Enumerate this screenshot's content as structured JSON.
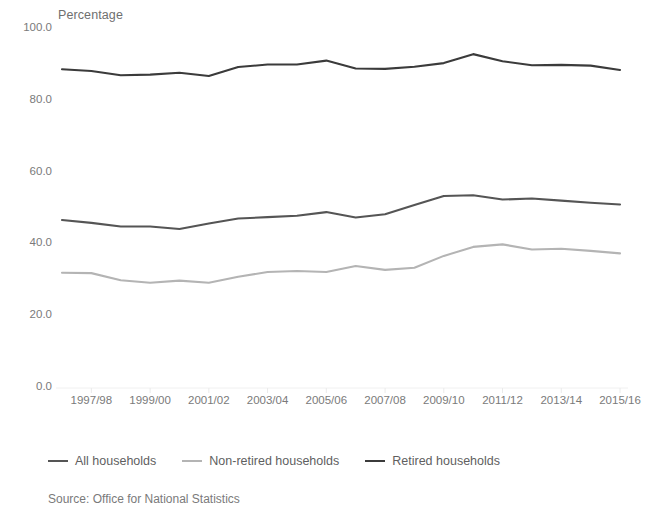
{
  "chart_data": {
    "type": "line",
    "title": "",
    "subtitle": "",
    "ylabel": "Percentage",
    "xlabel": "",
    "ylim": [
      0,
      100
    ],
    "yticks": [
      "0.0",
      "20.0",
      "40.0",
      "60.0",
      "80.0",
      "100.0"
    ],
    "ytick_values": [
      0,
      20,
      40,
      60,
      80,
      100
    ],
    "grid": false,
    "legend_position": "bottom-left",
    "categories": [
      "1996/97",
      "1997/98",
      "1998/99",
      "1999/00",
      "2000/01",
      "2001/02",
      "2002/03",
      "2003/04",
      "2004/05",
      "2005/06",
      "2006/07",
      "2007/08",
      "2008/09",
      "2009/10",
      "2010/11",
      "2011/12",
      "2012/13",
      "2013/14",
      "2014/15",
      "2015/16"
    ],
    "xtick_labels": [
      "1997/98",
      "1999/00",
      "2001/02",
      "2003/04",
      "2005/06",
      "2007/08",
      "2009/10",
      "2011/12",
      "2013/14",
      "2015/16"
    ],
    "xtick_indices": [
      1,
      3,
      5,
      7,
      9,
      11,
      13,
      15,
      17,
      19
    ],
    "series": [
      {
        "name": "All households",
        "color": "#555555",
        "width": 2.1,
        "values": [
          46.8,
          46.0,
          45.0,
          45.0,
          44.3,
          45.8,
          47.2,
          47.6,
          48.0,
          49.0,
          47.5,
          48.4,
          51.0,
          53.5,
          53.7,
          52.5,
          52.8,
          52.2,
          51.6,
          51.1
        ]
      },
      {
        "name": "Non-retired households",
        "color": "#b4b4b4",
        "width": 2.1,
        "values": [
          32.1,
          32.0,
          30.0,
          29.3,
          29.9,
          29.3,
          31.0,
          32.3,
          32.6,
          32.3,
          34.0,
          32.9,
          33.5,
          36.8,
          39.3,
          40.0,
          38.6,
          38.8,
          38.2,
          37.5
        ]
      },
      {
        "name": "Retired households",
        "color": "#3b3b3b",
        "width": 2.1,
        "values": [
          88.8,
          88.3,
          87.1,
          87.3,
          87.8,
          86.9,
          89.4,
          90.1,
          90.1,
          91.2,
          89.0,
          88.9,
          89.5,
          90.5,
          93.0,
          91.0,
          89.9,
          90.0,
          89.8,
          88.6
        ]
      }
    ]
  },
  "legend": {
    "items": [
      {
        "label": "All households",
        "color": "#555555"
      },
      {
        "label": "Non-retired households",
        "color": "#b4b4b4"
      },
      {
        "label": "Retired households",
        "color": "#3b3b3b"
      }
    ]
  },
  "source": {
    "text": "Source: Office for National Statistics"
  }
}
